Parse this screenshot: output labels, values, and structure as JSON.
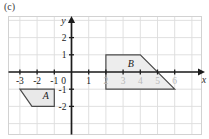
{
  "part": {
    "label": "(c)"
  },
  "chart_data": {
    "type": "scatter",
    "title": "",
    "xlabel": "x",
    "ylabel": "y",
    "grid": true,
    "legend": null,
    "xlim": [
      -4,
      7
    ],
    "ylim": [
      -3.3,
      2.7
    ],
    "xticks": [
      -3,
      -2,
      -1,
      0,
      1,
      2,
      3,
      4,
      5,
      6
    ],
    "yticks": [
      2,
      1,
      -1,
      -2
    ],
    "origin_label": "0",
    "xtick_labels": [
      "-3",
      "-2",
      "-1",
      "0",
      "1",
      "2",
      "3",
      "4",
      "5",
      "6"
    ],
    "ytick_labels": [
      "2",
      "1",
      "-1",
      "-2"
    ],
    "dim_xtick_labels": [
      "2",
      "3",
      "4",
      "5",
      "6"
    ],
    "shapes": [
      {
        "name": "A",
        "label": "A",
        "label_x": -1.5,
        "label_y": -1.55,
        "fill": "#e9e9e9",
        "stroke": "#4a4a4a",
        "vertices": [
          [
            -3,
            -1
          ],
          [
            -1,
            -1
          ],
          [
            -1,
            -2
          ],
          [
            -2.3,
            -2
          ]
        ]
      },
      {
        "name": "B",
        "label": "B",
        "label_x": 3.45,
        "label_y": 0.28,
        "fill": "#ededed",
        "stroke": "#4a4a4a",
        "vertices": [
          [
            2,
            1
          ],
          [
            4,
            1
          ],
          [
            6,
            -1
          ],
          [
            2,
            -1
          ]
        ]
      }
    ]
  },
  "colors": {
    "grid_line": "#dcdcdc",
    "grid_border": "#d2d2d2",
    "axis": "#1c1c1c",
    "shape_fill": "#ebebeb",
    "shape_stroke": "#4a4a4a",
    "text": "#1a1a1a",
    "dim_text": "#b9b9b9"
  }
}
